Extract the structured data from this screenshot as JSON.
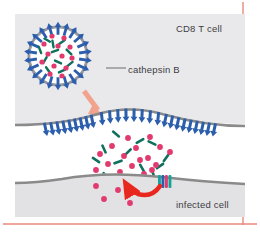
{
  "figure": {
    "frame": {
      "border_color": "#e8897c",
      "background": "#ffffff",
      "panel_left": 15,
      "panel_top": 14,
      "panel_width": 230,
      "panel_height": 203
    },
    "colors": {
      "tcell_cytoplasm": "#e9e9eb",
      "target_cytoplasm": "#e2e2e4",
      "synapse_cleft": "#ffffff",
      "membrane": "#8a8a8a",
      "perforin_blue": "#2b5fad",
      "granzyme_pink": "#e23a6e",
      "cathepsin_green": "#10705e",
      "release_arrow": "#f2a38e",
      "uptake_arrow": "#e8281e",
      "receptor_teal": "#14a39a",
      "label_text": "#3c3c42",
      "vesicle_ring": "#9a9a9f",
      "leader_line": "#6a6a70"
    },
    "labels": [
      {
        "id": "cd8",
        "text": "CD8 T cell",
        "x": 176,
        "y": 23
      },
      {
        "id": "infected",
        "text": "infected cell",
        "x": 176,
        "y": 199
      },
      {
        "id": "cathepsin",
        "text": "cathepsin B",
        "x": 128,
        "y": 64
      }
    ],
    "leader_line": {
      "x1": 106,
      "y1": 68,
      "x2": 126,
      "y2": 68
    },
    "granule": {
      "name": "cytotoxic granule",
      "cx": 58,
      "cy": 56,
      "r_outer": 30,
      "r_inner": 22,
      "perforin_count": 22,
      "granzyme_dots": [
        [
          52,
          36
        ],
        [
          64,
          38
        ],
        [
          44,
          44
        ],
        [
          58,
          46
        ],
        [
          70,
          47
        ],
        [
          48,
          54
        ],
        [
          62,
          56
        ],
        [
          72,
          58
        ],
        [
          42,
          62
        ],
        [
          54,
          66
        ],
        [
          66,
          68
        ],
        [
          50,
          74
        ],
        [
          62,
          76
        ]
      ],
      "cathepsin_rods": [
        [
          47,
          40,
          30
        ],
        [
          62,
          42,
          -35
        ],
        [
          40,
          50,
          70
        ],
        [
          55,
          51,
          -20
        ],
        [
          69,
          52,
          45
        ],
        [
          45,
          60,
          -60
        ],
        [
          58,
          62,
          25
        ],
        [
          70,
          64,
          -40
        ],
        [
          48,
          70,
          55
        ],
        [
          62,
          71,
          -25
        ],
        [
          53,
          44,
          80
        ]
      ]
    },
    "release_arrow": {
      "x1": 84,
      "y1": 92,
      "x2": 102,
      "y2": 113
    },
    "tcell_membrane": {
      "left_y": 124,
      "bulge_y": 112,
      "right_y": 124
    },
    "target_membrane": {
      "left_y": 182,
      "center_y": 176,
      "right_y": 182
    },
    "membrane_perforin_count": 26,
    "cleft_granzymes": [
      [
        128,
        138
      ],
      [
        150,
        137
      ],
      [
        112,
        146
      ],
      [
        136,
        148
      ],
      [
        160,
        147
      ],
      [
        100,
        154
      ],
      [
        124,
        156
      ],
      [
        148,
        158
      ],
      [
        170,
        152
      ],
      [
        108,
        164
      ],
      [
        132,
        166
      ],
      [
        156,
        165
      ],
      [
        120,
        172
      ],
      [
        144,
        174
      ],
      [
        96,
        170
      ],
      [
        118,
        186
      ],
      [
        134,
        190
      ],
      [
        108,
        196
      ],
      [
        126,
        200
      ],
      [
        152,
        170
      ],
      [
        140,
        160
      ]
    ],
    "cleft_cathepsins": [
      [
        116,
        134,
        40
      ],
      [
        140,
        141,
        -30
      ],
      [
        104,
        149,
        65
      ],
      [
        128,
        152,
        -45
      ],
      [
        152,
        143,
        25
      ],
      [
        166,
        158,
        -55
      ],
      [
        96,
        160,
        35
      ],
      [
        118,
        162,
        -20
      ],
      [
        142,
        168,
        60
      ],
      [
        160,
        166,
        -35
      ],
      [
        106,
        176,
        50
      ],
      [
        130,
        178,
        -25
      ],
      [
        154,
        176,
        70
      ]
    ],
    "receptor": {
      "name": "granzyme uptake receptor",
      "x": 158,
      "y": 175,
      "width": 14,
      "height": 13,
      "stripes": [
        "#14a39a",
        "#2b5fad",
        "#e23a6e",
        "#14a39a"
      ]
    },
    "uptake_arrow": {
      "description": "red curved arrow from receptor into infected cell cytoplasm",
      "start_x": 162,
      "start_y": 188,
      "end_x": 124,
      "end_y": 180
    }
  }
}
